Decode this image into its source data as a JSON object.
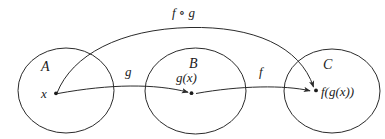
{
  "diagram": {
    "stroke_color": "#2b2b2b",
    "text_color": "#1b1b1b",
    "background_color": "#ffffff",
    "sets": [
      {
        "id": "A",
        "label": "A",
        "element_label": "x"
      },
      {
        "id": "B",
        "label": "B",
        "element_label": "g(x)"
      },
      {
        "id": "C",
        "label": "C",
        "element_label": "f(g(x))"
      }
    ],
    "maps": [
      {
        "id": "g",
        "label": "g",
        "from": "A",
        "to": "B"
      },
      {
        "id": "f",
        "label": "f",
        "from": "B",
        "to": "C"
      },
      {
        "id": "fg",
        "label": "f ∘ g",
        "from": "A",
        "to": "C"
      }
    ]
  }
}
